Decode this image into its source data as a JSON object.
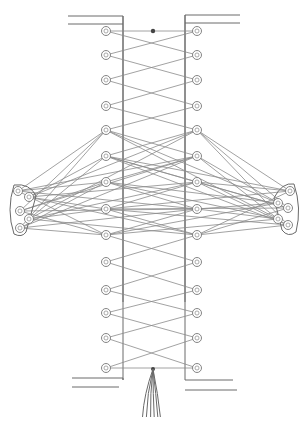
{
  "diagram": {
    "title": "",
    "colors": {
      "line": "#6a6a6a",
      "lace": "#8a8a8a",
      "background": "#ffffff"
    },
    "panel": {
      "left_edge_x": 123,
      "right_edge_x": 185,
      "top_y": 16,
      "bottom_y": 380
    },
    "eyelets_left": [
      31,
      55,
      80,
      106,
      130,
      156,
      182,
      209,
      235,
      262,
      290,
      313,
      338,
      368
    ],
    "eyelets_right": [
      31,
      55,
      80,
      106,
      130,
      156,
      182,
      209,
      235,
      262,
      290,
      313,
      338,
      368
    ],
    "left_cluster": [
      [
        18,
        191
      ],
      [
        29,
        197
      ],
      [
        20,
        211
      ],
      [
        29,
        219
      ],
      [
        20,
        228
      ]
    ],
    "right_cluster": [
      [
        290,
        191
      ],
      [
        278,
        203
      ],
      [
        288,
        208
      ],
      [
        278,
        219
      ],
      [
        288,
        225
      ]
    ],
    "knot_top": {
      "x": 153,
      "y": 31
    },
    "tassel": {
      "x": 153,
      "y": 369
    }
  }
}
